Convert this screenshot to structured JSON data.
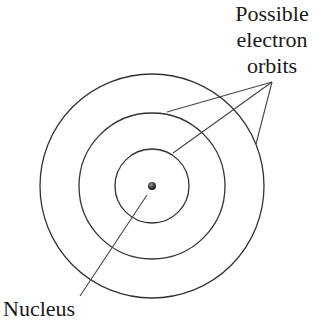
{
  "diagram": {
    "labels": {
      "orbits": [
        "Possible",
        "electron",
        "orbits"
      ],
      "nucleus": "Nucleus"
    },
    "center": [
      152,
      186
    ],
    "nucleus_radius": 4,
    "orbits": [
      {
        "name": "inner-orbit",
        "radius": 37
      },
      {
        "name": "middle-orbit",
        "radius": 73
      },
      {
        "name": "outer-orbit",
        "radius": 112
      }
    ],
    "pointers": {
      "orbits_apex": [
        272,
        82
      ],
      "orbits_targets": [
        [
          167,
          112
        ],
        [
          173,
          153
        ],
        [
          256,
          144
        ]
      ],
      "nucleus_line": [
        [
          147,
          195
        ],
        [
          80,
          296
        ]
      ]
    },
    "colors": {
      "stroke": "#333333",
      "text": "#1a1a1a",
      "background": "#ffffff"
    }
  }
}
